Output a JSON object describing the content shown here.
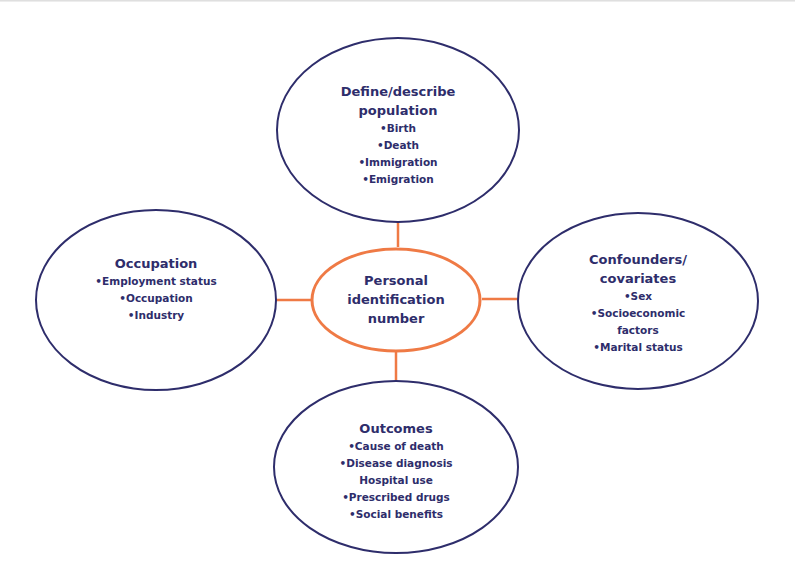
{
  "colors": {
    "outer_stroke": "#2e2d6b",
    "center_stroke": "#ef7a45",
    "connector": "#ef7a45",
    "text": "#2e2d6b",
    "background": "#ffffff"
  },
  "center": {
    "title_lines": [
      "Personal",
      "identification",
      "number"
    ]
  },
  "nodes": {
    "top": {
      "title_lines": [
        "Define/describe",
        "population"
      ],
      "items": [
        "•Birth",
        "•Death",
        "•Immigration",
        "•Emigration"
      ]
    },
    "left": {
      "title_lines": [
        "Occupation"
      ],
      "items": [
        "•Employment status",
        "•Occupation",
        "•Industry"
      ]
    },
    "right": {
      "title_lines": [
        "Confounders/",
        "covariates"
      ],
      "items": [
        "•Sex",
        "•Socioeconomic",
        "factors",
        "•Marital status"
      ]
    },
    "bottom": {
      "title_lines": [
        "Outcomes"
      ],
      "items": [
        "•Cause of death",
        "•Disease diagnosis",
        "Hospital use",
        "•Prescribed drugs",
        "•Social benefits"
      ]
    }
  }
}
